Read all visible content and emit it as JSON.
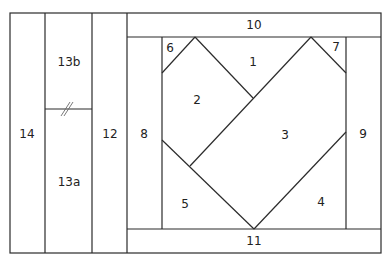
{
  "diagram": {
    "type": "quilt-block-piecing-pattern",
    "labels": {
      "p1": "1",
      "p2": "2",
      "p3": "3",
      "p4": "4",
      "p5": "5",
      "p6": "6",
      "p7": "7",
      "p8": "8",
      "p9": "9",
      "p10": "10",
      "p11": "11",
      "p12": "12",
      "p13a": "13a",
      "p13b": "13b",
      "p14": "14"
    },
    "colors": {
      "line": "#2b2b2b",
      "background": "#ffffff",
      "text": "#222222"
    }
  }
}
